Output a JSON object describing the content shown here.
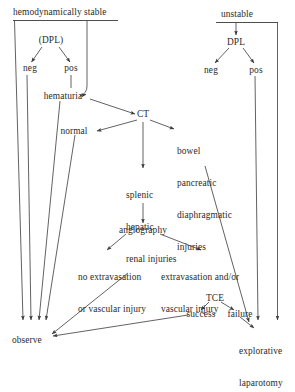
{
  "diagram": {
    "type": "flowchart",
    "background_color": "#ffffff",
    "line_color": "#3a3a3a",
    "text_color": "#2b2b2b"
  },
  "nodes": {
    "hemodynamically_stable": "hemodynamically stable",
    "unstable": "unstable",
    "dpl_stable": "(DPL)",
    "dpl_unstable": "DPL",
    "neg_stable": "neg",
    "pos_stable": "pos",
    "neg_unstable": "neg",
    "pos_unstable": "pos",
    "hematuria": "hematuria",
    "ct": "CT",
    "normal": "normal",
    "bowel_injuries_l1": "bowel",
    "bowel_injuries_l2": "pancreatic",
    "bowel_injuries_l3": "diaphragmatic",
    "bowel_injuries_l4": "injuries",
    "solid_injuries_l1": "splenic",
    "solid_injuries_l2": "hepatic",
    "solid_injuries_l3": "renal injuries",
    "angiography": "angiography",
    "no_extrav_l1": "no extravasation",
    "no_extrav_l2": "or vascular injury",
    "extrav_l1": "extravasation and/or",
    "extrav_l2": "vascular injury",
    "tce": "TCE",
    "success": "success",
    "failure": "failure",
    "observe": "observe",
    "explorative_l1": "explorative",
    "explorative_l2": "laparotomy"
  },
  "edges": [
    {
      "from": "hemodynamically stable",
      "to": "(DPL)"
    },
    {
      "from": "hemodynamically stable",
      "to": "observe"
    },
    {
      "from": "hemodynamically stable",
      "to": "hematuria"
    },
    {
      "from": "(DPL)",
      "to": "neg"
    },
    {
      "from": "(DPL)",
      "to": "pos"
    },
    {
      "from": "neg",
      "to": "observe"
    },
    {
      "from": "pos",
      "to": "hematuria"
    },
    {
      "from": "hematuria",
      "to": "CT"
    },
    {
      "from": "hematuria",
      "to": "observe"
    },
    {
      "from": "CT",
      "to": "normal"
    },
    {
      "from": "CT",
      "to": "bowel pancreatic diaphragmatic injuries"
    },
    {
      "from": "CT",
      "to": "splenic hepatic renal injuries"
    },
    {
      "from": "normal",
      "to": "observe"
    },
    {
      "from": "bowel pancreatic diaphragmatic injuries",
      "to": "explorative laparotomy"
    },
    {
      "from": "splenic hepatic renal injuries",
      "to": "angiography"
    },
    {
      "from": "angiography",
      "to": "no extravasation or vascular injury"
    },
    {
      "from": "angiography",
      "to": "extravasation and/or vascular injury"
    },
    {
      "from": "no extravasation or vascular injury",
      "to": "observe"
    },
    {
      "from": "TCE",
      "to": "success"
    },
    {
      "from": "TCE",
      "to": "failure"
    },
    {
      "from": "success",
      "to": "observe"
    },
    {
      "from": "failure",
      "to": "explorative laparotomy"
    },
    {
      "from": "unstable",
      "to": "DPL"
    },
    {
      "from": "unstable",
      "to": "explorative laparotomy"
    },
    {
      "from": "DPL",
      "to": "neg"
    },
    {
      "from": "DPL",
      "to": "pos"
    },
    {
      "from": "pos",
      "to": "explorative laparotomy"
    }
  ]
}
